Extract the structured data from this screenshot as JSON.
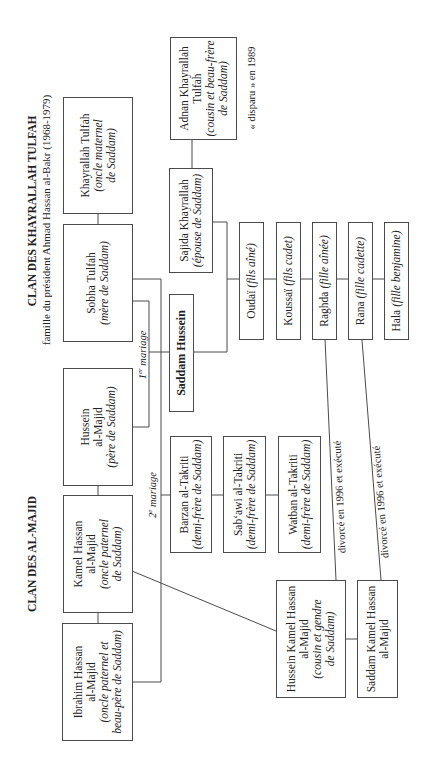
{
  "diagram": {
    "titles": {
      "khayrallah_clan": "CLAN DES KHAYRALLAH TULFAH",
      "khayrallah_subtitle": "famille du président Ahmad Hassan al-Bakr (1968-1979)",
      "majid_clan": "CLAN DES AL-MAJID"
    },
    "nodes": {
      "ibrahim": {
        "name": [
          "Ibrahim Hassan",
          "al-Majid"
        ],
        "role": [
          "(oncle paternel et",
          "beau-père de Saddam)"
        ]
      },
      "kamel": {
        "name": [
          "Kamel Hassan",
          "al-Majid"
        ],
        "role": [
          "(oncle paternel",
          "de Saddam)"
        ]
      },
      "hussein_majid": {
        "name": [
          "Hussein",
          "al-Majid"
        ],
        "role": [
          "(père de Saddam)"
        ]
      },
      "sobha": {
        "name": [
          "Sobha Tulfah"
        ],
        "role": [
          "(mère de Saddam)"
        ]
      },
      "khayrallah": {
        "name": [
          "Khayrallah Tulfah"
        ],
        "role": [
          "(oncle maternel",
          "de Saddam)"
        ]
      },
      "adnan": {
        "name": [
          "Adnan Khayrallah",
          "Tulfah"
        ],
        "role": [
          "(cousin et beau-frère",
          "de Saddam)"
        ]
      },
      "sajida": {
        "name": [
          "Sajida Khayrallah"
        ],
        "role": [
          "(épouse de Saddam)"
        ]
      },
      "saddam": {
        "name": [
          "Saddam Hussein"
        ]
      },
      "barzan": {
        "name": [
          "Barzan al-Takriti"
        ],
        "role": [
          "(demi-frère de Saddam)"
        ]
      },
      "sabawi": {
        "name": [
          "Sab‘awi al-Takriti"
        ],
        "role": [
          "(demi-frère de Saddam)"
        ]
      },
      "watban": {
        "name": [
          "Watban al-Takriti"
        ],
        "role": [
          "(demi-frère de Saddam)"
        ]
      },
      "oudai": {
        "name": [
          "Oudaï"
        ],
        "role": [
          "(fils aîné)"
        ]
      },
      "koussai": {
        "name": [
          "Koussaï"
        ],
        "role": [
          "(fils cadet)"
        ]
      },
      "raghda": {
        "name": [
          "Raghda"
        ],
        "role": [
          "(fille aînée)"
        ]
      },
      "rana": {
        "name": [
          "Rana"
        ],
        "role": [
          "(fille cadette)"
        ]
      },
      "hala": {
        "name": [
          "Hala"
        ],
        "role": [
          "(fille benjamine)"
        ]
      },
      "hussein_kamel": {
        "name": [
          "Hussein Kamel Hassan",
          "al-Majid"
        ],
        "role": [
          "(cousin et gendre",
          "de Saddam)"
        ]
      },
      "saddam_kamel": {
        "name": [
          "Saddam Kamel Hassan",
          "al-Majid"
        ]
      }
    },
    "annotations": {
      "first_marriage": {
        "num": "1",
        "sup": "er",
        "text": " mariage"
      },
      "second_marriage": {
        "num": "2",
        "sup": "e",
        "text": " mariage"
      },
      "adnan_note": "« disparu » en 1989",
      "raghda_divorce": "divorcé en 1996 et exécuté",
      "rana_divorce": "divorcé en 1996 et exécuté"
    },
    "edges": [
      {
        "from": "khayrallah",
        "to": "sobha",
        "type": "siblings"
      },
      {
        "from": "hussein_majid",
        "to": "kamel",
        "type": "siblings"
      },
      {
        "from": "kamel",
        "to": "ibrahim",
        "type": "siblings"
      },
      {
        "from": "sobha",
        "to": "hussein_majid",
        "type": "marriage",
        "label": "1er mariage"
      },
      {
        "from": "sobha",
        "to": "ibrahim",
        "type": "marriage",
        "label": "2e mariage"
      },
      {
        "from": "adnan",
        "to": "sajida",
        "type": "siblings"
      },
      {
        "from": "saddam",
        "to": "sajida",
        "type": "marriage"
      },
      {
        "from": "kamel",
        "to": "hussein_kamel",
        "type": "parent"
      },
      {
        "from": "hussein_kamel",
        "to": "saddam_kamel",
        "type": "siblings"
      },
      {
        "from": "raghda",
        "to": "hussein_kamel",
        "type": "marriage",
        "label": "divorcé en 1996 et exécuté"
      },
      {
        "from": "rana",
        "to": "saddam_kamel",
        "type": "marriage",
        "label": "divorcé en 1996 et exécuté"
      }
    ]
  }
}
